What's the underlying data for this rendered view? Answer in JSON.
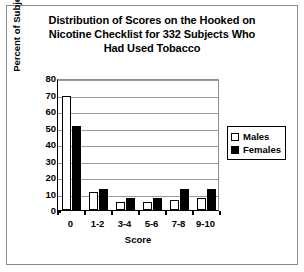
{
  "chart_data": {
    "type": "bar",
    "title": "Distribution of Scores on the Hooked on Nicotine Checklist for 332 Subjects Who Had Used Tobacco",
    "title_lines": [
      "Distribution of Scores on the Hooked on",
      "Nicotine Checklist for 332 Subjects Who",
      "Had Used Tobacco"
    ],
    "xlabel": "Score",
    "ylabel": "Percent of Subjects",
    "categories": [
      "0",
      "1-2",
      "3-4",
      "5-6",
      "7-8",
      "9-10"
    ],
    "series": [
      {
        "name": "Males",
        "color": "#ffffff",
        "values": [
          69,
          11,
          5,
          5,
          6,
          7
        ]
      },
      {
        "name": "Females",
        "color": "#000000",
        "values": [
          51,
          13,
          7,
          7,
          13,
          13
        ]
      }
    ],
    "ylim": [
      0,
      80
    ],
    "y_ticks": [
      80,
      70,
      60,
      50,
      40,
      30,
      20,
      10,
      0
    ],
    "grid": true,
    "legend_position": "right",
    "legend_entries": [
      "Males",
      "Females"
    ]
  }
}
